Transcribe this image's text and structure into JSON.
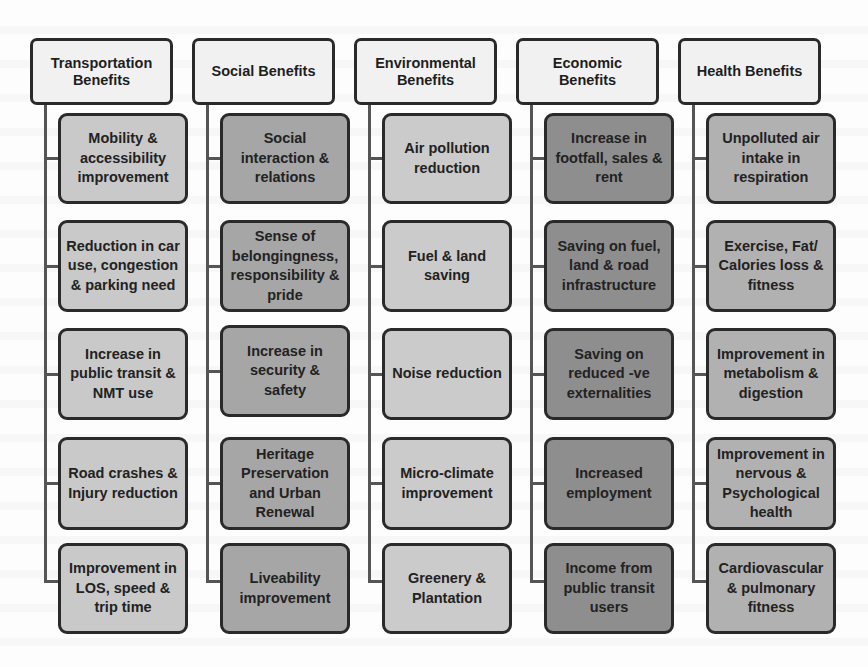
{
  "diagram": {
    "columns": [
      {
        "title": "Transportation Benefits",
        "fill": "#c9c9c9",
        "items": [
          "Mobility & accessibility improvement",
          "Reduction in car use, congestion & parking need",
          "Increase in public transit & NMT use",
          "Road crashes & Injury reduction",
          "Improvement in LOS, speed & trip time"
        ]
      },
      {
        "title": "Social Benefits",
        "fill": "#a6a6a6",
        "items": [
          "Social interaction & relations",
          "Sense of belongingness, responsibility & pride",
          "Increase in security & safety",
          "Heritage Preservation and Urban Renewal",
          "Liveability improvement"
        ]
      },
      {
        "title": "Environmental Benefits",
        "fill": "#cbcbcb",
        "items": [
          "Air pollution reduction",
          "Fuel & land saving",
          "Noise reduction",
          "Micro-climate improvement",
          "Greenery & Plantation"
        ]
      },
      {
        "title": "Economic Benefits",
        "fill": "#8e8e8e",
        "items": [
          "Increase in footfall, sales & rent",
          "Saving on fuel, land & road infrastructure",
          "Saving on reduced -ve externalities",
          "Increased employment",
          "Income from public transit users"
        ]
      },
      {
        "title": "Health Benefits",
        "fill": "#b1b1b1",
        "items": [
          "Unpolluted air intake in respiration",
          "Exercise, Fat/ Calories loss & fitness",
          "Improvement in metabolism & digestion",
          "Improvement in nervous & Psychological health",
          "Cardiovascular & pulmonary fitness"
        ]
      }
    ]
  }
}
